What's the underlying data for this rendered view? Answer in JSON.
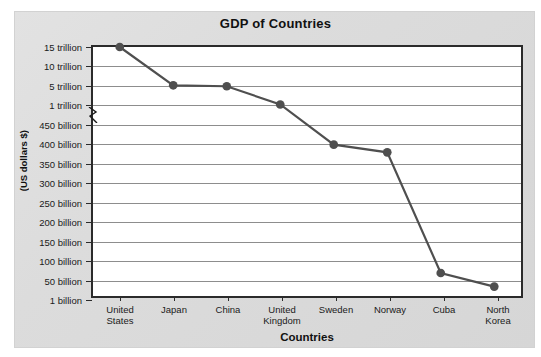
{
  "chart_data": {
    "type": "line",
    "title": "GDP of Countries",
    "xlabel": "Countries",
    "ylabel": "(US dollars $)",
    "categories": [
      "United States",
      "Japan",
      "China",
      "United Kingdom",
      "Sweden",
      "Norway",
      "Cuba",
      "North Korea"
    ],
    "category_lines": [
      [
        "United",
        "States"
      ],
      [
        "Japan",
        ""
      ],
      [
        "China",
        ""
      ],
      [
        "United",
        "Kingdom"
      ],
      [
        "Sweden",
        ""
      ],
      [
        "Norway",
        ""
      ],
      [
        "Cuba",
        ""
      ],
      [
        "North",
        "Korea"
      ]
    ],
    "values": [
      15000,
      5000,
      4800,
      1000,
      395,
      375,
      60,
      25
    ],
    "value_labels": [
      "15 trillion",
      "5 trillion",
      "~4.8 trillion",
      "1 trillion",
      "~395 billion",
      "~375 billion",
      "~60 billion",
      "~25 billion"
    ],
    "ytick_labels": [
      "15 trillion",
      "10 trillion",
      "5 trillion",
      "1 trillion",
      "450 billion",
      "400 billion",
      "350 billion",
      "300 billion",
      "250 billion",
      "200 billion",
      "150 billion",
      "100 billion",
      "50 billion",
      "1 billion"
    ],
    "ytick_values": [
      15000,
      10000,
      5000,
      1000,
      450,
      400,
      350,
      300,
      250,
      200,
      150,
      100,
      50,
      1
    ],
    "axis_break": {
      "present": true,
      "between": [
        "1 trillion",
        "450 billion"
      ]
    },
    "grid": true,
    "legend": "none",
    "series_color": "#4f4f4f",
    "marker": "circle",
    "plot_background": "#ffffff",
    "panel_background": "#dcdcdc"
  }
}
